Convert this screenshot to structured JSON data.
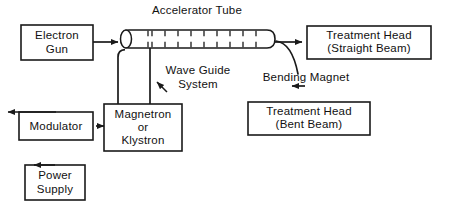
{
  "diagram": {
    "title_label": "Accelerator Tube",
    "background_color": "#ffffff",
    "line_color": "#1a1a1a",
    "text_color": "#111111",
    "width": 450,
    "height": 208
  },
  "boxes": {
    "electron_gun": {
      "name": "electron-gun",
      "line1": "Electron",
      "line2": "Gun"
    },
    "modulator": {
      "name": "modulator",
      "line1": "Modulator"
    },
    "power_supply": {
      "name": "power-supply",
      "line1": "Power",
      "line2": "Supply"
    },
    "magnetron": {
      "name": "magnetron-or-klystron",
      "line1": "Magnetron",
      "line2": "or",
      "line3": "Klystron"
    },
    "treatment_head_straight": {
      "name": "treatment-head-straight-beam",
      "line1": "Treatment Head",
      "line2": "(Straight  Beam)"
    },
    "treatment_head_bent": {
      "name": "treatment-head-bent-beam",
      "line1": "Treatment Head",
      "line2": "(Bent Beam)"
    }
  },
  "labels": {
    "accelerator_tube": "Accelerator Tube",
    "wave_guide_line1": "Wave Guide",
    "wave_guide_line2": "System",
    "bending_magnet": "Bending  Magnet"
  },
  "components": {
    "accelerator_tube_ticks": 10
  }
}
